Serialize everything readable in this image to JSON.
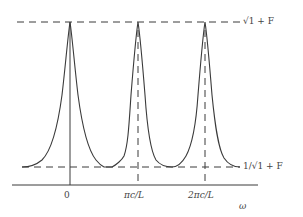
{
  "diagram": {
    "x_axis": {
      "label": "ω",
      "ticks": [
        {
          "label": "0",
          "x": 70
        },
        {
          "label": "πc/L",
          "x": 138
        },
        {
          "label": "2πc/L",
          "x": 205
        }
      ]
    },
    "levels": {
      "max_label": "√1 + F",
      "min_label": "1/√1 + F"
    },
    "peaks": [
      {
        "position": "0",
        "vertical_line": "solid"
      },
      {
        "position": "πc/L",
        "vertical_line": "dashed"
      },
      {
        "position": "2πc/L",
        "vertical_line": "dashed"
      }
    ],
    "colors": {
      "line": "#3a3a3a",
      "text": "#444444",
      "background": "#ffffff"
    }
  }
}
